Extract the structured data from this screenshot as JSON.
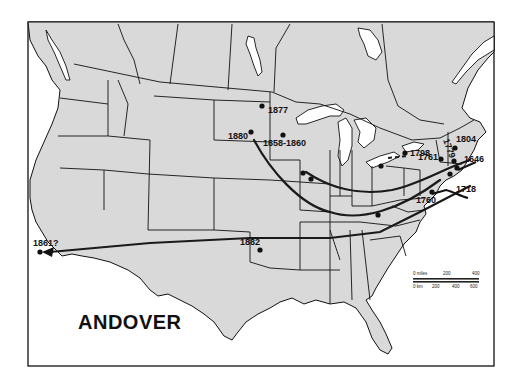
{
  "map": {
    "title": "ANDOVER",
    "frame": {
      "x": 28,
      "y": 22,
      "width": 466,
      "height": 344
    },
    "colors": {
      "land": "#d9d9d9",
      "water": "#ffffff",
      "line": "#111111"
    },
    "settlements": [
      {
        "label": "1877",
        "x": 262,
        "y": 106,
        "lx": 268,
        "ly": 113
      },
      {
        "label": "1880",
        "x": 251,
        "y": 132,
        "lx": 228,
        "ly": 139
      },
      {
        "label": "1858-1860",
        "x": 283,
        "y": 135,
        "lx": 263,
        "ly": 146
      },
      {
        "label": "1761",
        "x": 441,
        "y": 159,
        "lx": 418,
        "ly": 160
      },
      {
        "label": "1779",
        "x": 454,
        "y": 161,
        "lx": 443,
        "ly": 140
      },
      {
        "label": "1804",
        "x": 455,
        "y": 148,
        "lx": 456,
        "ly": 142
      },
      {
        "label": "1646",
        "x": 457,
        "y": 168,
        "lx": 464,
        "ly": 162
      },
      {
        "label": "1798",
        "x": 405,
        "y": 153,
        "lx": 410,
        "ly": 156
      },
      {
        "label": "1718",
        "x": 450,
        "y": 174,
        "lx": 456,
        "ly": 192
      },
      {
        "label": "1760",
        "x": 432,
        "y": 192,
        "lx": 416,
        "ly": 203
      },
      {
        "label": "1882",
        "x": 260,
        "y": 250,
        "lx": 240,
        "ly": 245
      },
      {
        "label": "1861?",
        "x": 40,
        "y": 252,
        "lx": 33,
        "ly": 246
      },
      {
        "label": "",
        "x": 381,
        "y": 166
      },
      {
        "label": "",
        "x": 303,
        "y": 173
      },
      {
        "label": "",
        "x": 311,
        "y": 179
      },
      {
        "label": "",
        "x": 378,
        "y": 215
      }
    ],
    "scale_bar": {
      "miles_label": "0 miles",
      "miles_ticks": [
        "200",
        "400"
      ],
      "km_label": "0 km",
      "km_ticks": [
        "200",
        "400",
        "600"
      ]
    }
  }
}
